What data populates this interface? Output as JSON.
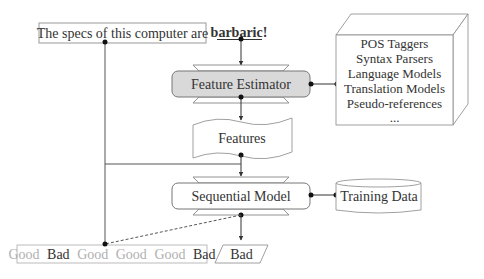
{
  "diagram": {
    "input_sentence": "The specs of this computer are",
    "target_word": "barbaric!",
    "feature_estimator": "Feature Estimator",
    "resources": [
      "POS Taggers",
      "Syntax Parsers",
      "Language Models",
      "Translation Models",
      "Pseudo-references",
      "..."
    ],
    "features": "Features",
    "sequential_model": "Sequential Model",
    "training_data": "Training Data",
    "previous_labels": [
      {
        "label": "Good",
        "active": false
      },
      {
        "label": "Bad",
        "active": true
      },
      {
        "label": "Good",
        "active": false
      },
      {
        "label": "Good",
        "active": false
      },
      {
        "label": "Good",
        "active": false
      },
      {
        "label": "Bad",
        "active": true
      }
    ],
    "output_label": "Bad"
  },
  "colors": {
    "stroke": "#555555",
    "estimator_fill": "#d9d9d9",
    "text": "#333333",
    "inactive_label": "#b0b0b0",
    "light_border": "#aaaaaa"
  }
}
